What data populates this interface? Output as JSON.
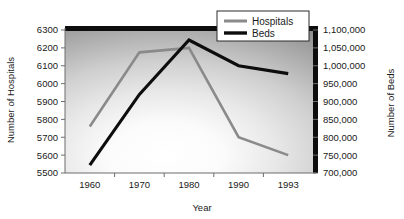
{
  "chart_data": {
    "type": "line",
    "title": "",
    "xlabel": "Year",
    "categories": [
      "1960",
      "1970",
      "1980",
      "1990",
      "1993"
    ],
    "grid": false,
    "legend_position": "top-right",
    "series": [
      {
        "name": "Hospitals",
        "axis": "left",
        "color": "#8a8a8a",
        "values": [
          5760,
          6175,
          6200,
          5700,
          5600
        ]
      },
      {
        "name": "Beds",
        "axis": "right",
        "color": "#0d0d0d",
        "values": [
          722000,
          920000,
          1072000,
          1000000,
          978000
        ]
      }
    ],
    "left_axis": {
      "label": "Number of Hospitals",
      "ylim": [
        5500,
        6300
      ],
      "ticks": [
        5500,
        5600,
        5700,
        5800,
        5900,
        6000,
        6100,
        6200,
        6300
      ],
      "tick_labels": [
        "5500",
        "5600",
        "5700",
        "5800",
        "5900",
        "6000",
        "6100",
        "6200",
        "6300"
      ]
    },
    "right_axis": {
      "label": "Number of Beds",
      "ylim": [
        700000,
        1100000
      ],
      "ticks": [
        700000,
        750000,
        800000,
        850000,
        900000,
        950000,
        1000000,
        1050000,
        1100000
      ],
      "tick_labels": [
        "700,000",
        "750,000",
        "800,000",
        "850,000",
        "900,000",
        "950,000",
        "1,000,000",
        "1,050,000",
        "1,100,000"
      ]
    }
  },
  "legend": {
    "entries": [
      {
        "label": "Hospitals",
        "color": "#8a8a8a"
      },
      {
        "label": "Beds",
        "color": "#0d0d0d"
      }
    ]
  },
  "colors": {
    "hospitals": "#8a8a8a",
    "beds": "#0d0d0d",
    "axis": "#6d6d6d",
    "text": "#1a1a1a",
    "plot_center": "#ffffff",
    "plot_edge": "#8f8f8f"
  }
}
